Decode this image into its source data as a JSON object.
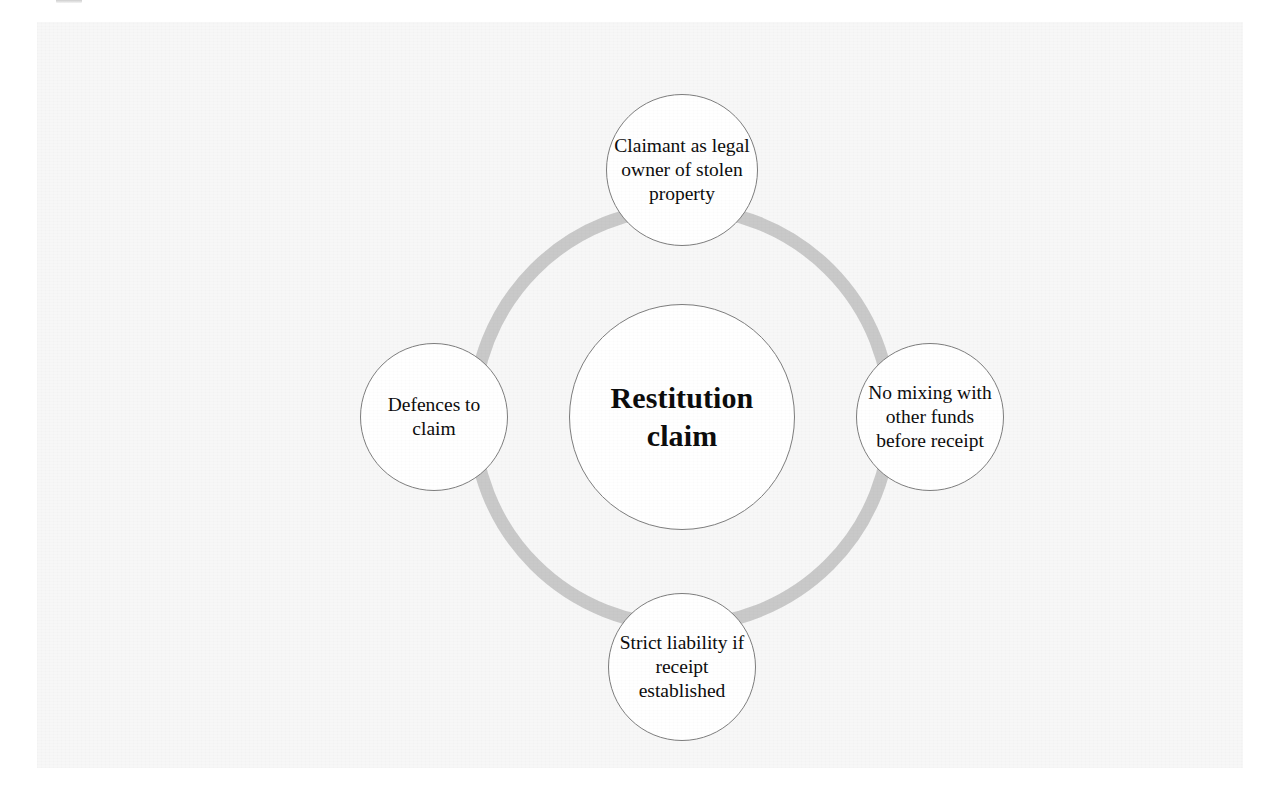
{
  "figure": {
    "type": "cycle-hub-and-spoke-diagram",
    "background_color": "#f7f7f7",
    "page_background_color": "#ffffff",
    "ring_color": "#c9c9c9",
    "node_fill_color": "#ffffff",
    "node_border_color": "#7e7e7e",
    "text_color": "#0d0d0d"
  },
  "center": {
    "label": "Restitution claim",
    "name": "center-node"
  },
  "nodes": [
    {
      "position": "top",
      "label": "Claimant as legal owner of stolen property"
    },
    {
      "position": "right",
      "label": "No mixing with other funds before receipt"
    },
    {
      "position": "bottom",
      "label": "Strict liability if receipt established"
    },
    {
      "position": "left",
      "label": "Defences to claim"
    }
  ]
}
